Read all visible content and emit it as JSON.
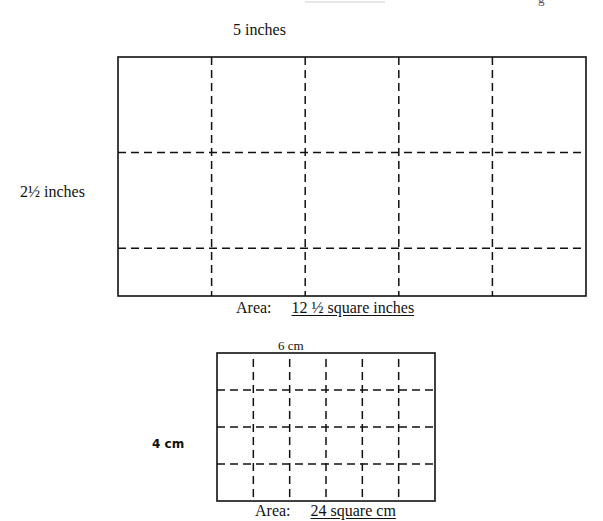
{
  "top_fragment": {
    "glyph": "g"
  },
  "large_rectangle": {
    "width_label": "5 inches",
    "height_label": "2½ inches",
    "columns": 5,
    "rows": 2.5,
    "area_prefix": "Area:",
    "area_value": "12 ½ square inches"
  },
  "small_rectangle": {
    "width_label": "6 cm",
    "height_label": "4 cm",
    "columns": 6,
    "rows": 4,
    "area_prefix": "Area:",
    "area_value": "24 square cm"
  },
  "colors": {
    "line": "#111111",
    "background": "#ffffff"
  }
}
